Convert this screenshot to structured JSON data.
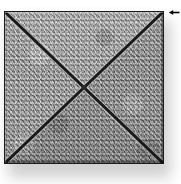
{
  "figure": {
    "background_color": "#ffffff",
    "width": 181,
    "height": 184
  },
  "tile": {
    "name": "textured-square-tile",
    "shape": "square",
    "fill_description": "mottled grayscale granular stone texture",
    "base_color": "#a3a3a3",
    "border_color": "#1c1c1c",
    "border_width_px": 1,
    "left_px": 4,
    "top_px": 11,
    "width_px": 160,
    "height_px": 153,
    "highlight_color": "#d8d8d8",
    "shade_color": "#6a6a6a"
  },
  "diagonals": {
    "name": "x-grooves",
    "count": 2,
    "color": "#1a1a1a",
    "highlight_color": "#cfcfcf",
    "stroke_width_px": 3,
    "description": "two corner-to-corner grooves meeting at the center, dividing the tile into four triangular faces"
  },
  "quadrants": [
    {
      "name": "top-face",
      "position": "top",
      "shade": "#a8a8a8"
    },
    {
      "name": "right-face",
      "position": "right",
      "shade": "#a0a0a0"
    },
    {
      "name": "bottom-face",
      "position": "bottom",
      "shade": "#9c9c9c"
    },
    {
      "name": "left-face",
      "position": "left",
      "shade": "#a4a4a4"
    }
  ],
  "center_point": {
    "name": "apex-point",
    "x_px": 84,
    "y_px": 88,
    "color": "#2a2a2a"
  },
  "shadow": {
    "name": "drop-shadow",
    "color": "#9a9a9a",
    "offset_x_px": 4,
    "offset_y_px": 9,
    "blur_px": 7,
    "opacity": 0.45
  },
  "marker": {
    "name": "arrow-marker",
    "icon": "arrow-left-icon",
    "color": "#000000",
    "x_px": 169,
    "y_px": 9,
    "direction": "left",
    "label": ""
  }
}
